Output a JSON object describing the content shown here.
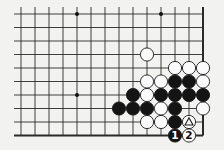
{
  "diagram": {
    "background": "#f2f2f0",
    "line_color": "#2a2a2a",
    "grid": {
      "cols": 14,
      "rows": 10,
      "x0": 21,
      "y0": 14,
      "dx": 14,
      "dy": 13.5,
      "right_edge": true,
      "bottom_edge": true,
      "open_left": true,
      "open_top": true
    },
    "hoshi": [
      {
        "col": 4,
        "row": 0
      },
      {
        "col": 10,
        "row": 0
      },
      {
        "col": 4,
        "row": 6
      }
    ],
    "stones": [
      {
        "col": 9,
        "row": 3,
        "color": "white"
      },
      {
        "col": 11,
        "row": 4,
        "color": "white"
      },
      {
        "col": 12,
        "row": 4,
        "color": "white"
      },
      {
        "col": 13,
        "row": 4,
        "color": "white"
      },
      {
        "col": 9,
        "row": 5,
        "color": "white"
      },
      {
        "col": 10,
        "row": 5,
        "color": "white"
      },
      {
        "col": 11,
        "row": 5,
        "color": "black"
      },
      {
        "col": 12,
        "row": 5,
        "color": "black"
      },
      {
        "col": 13,
        "row": 5,
        "color": "white"
      },
      {
        "col": 8,
        "row": 6,
        "color": "black"
      },
      {
        "col": 9,
        "row": 6,
        "color": "white"
      },
      {
        "col": 10,
        "row": 6,
        "color": "black"
      },
      {
        "col": 11,
        "row": 6,
        "color": "black"
      },
      {
        "col": 12,
        "row": 6,
        "color": "black"
      },
      {
        "col": 13,
        "row": 6,
        "color": "black"
      },
      {
        "col": 7,
        "row": 7,
        "color": "black"
      },
      {
        "col": 8,
        "row": 7,
        "color": "black"
      },
      {
        "col": 9,
        "row": 7,
        "color": "black"
      },
      {
        "col": 10,
        "row": 7,
        "color": "white"
      },
      {
        "col": 11,
        "row": 7,
        "color": "black"
      },
      {
        "col": 13,
        "row": 7,
        "color": "white"
      },
      {
        "col": 9,
        "row": 8,
        "color": "white"
      },
      {
        "col": 10,
        "row": 8,
        "color": "white"
      },
      {
        "col": 11,
        "row": 8,
        "color": "black"
      },
      {
        "col": 12,
        "row": 8,
        "color": "white",
        "mark": "triangle"
      },
      {
        "col": 11,
        "row": 9,
        "color": "black",
        "label": "1"
      },
      {
        "col": 12,
        "row": 9,
        "color": "white",
        "label": "2"
      }
    ],
    "move_labels": [
      "1",
      "2"
    ]
  }
}
